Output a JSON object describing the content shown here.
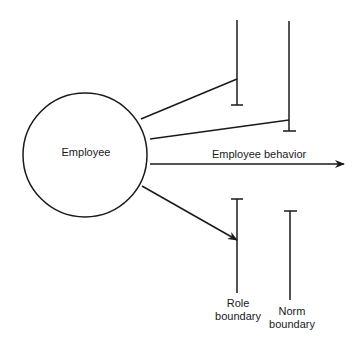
{
  "diagram": {
    "node": {
      "label": "Employee"
    },
    "main_arrow": {
      "label": "Employee behavior"
    },
    "boundaries": [
      {
        "label_line1": "Role",
        "label_line2": "boundary"
      },
      {
        "label_line1": "Norm",
        "label_line2": "boundary"
      }
    ],
    "colors": {
      "stroke": "#1a1a1a",
      "background": "#ffffff"
    }
  }
}
